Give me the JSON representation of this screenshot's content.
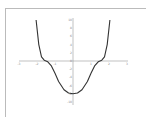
{
  "chart_data": {
    "type": "line",
    "title": "",
    "xlabel": "",
    "ylabel": "",
    "xlim": [
      -3,
      3
    ],
    "ylim": [
      -10,
      10
    ],
    "x_ticks": [
      "-3",
      "-2",
      "-1",
      "0",
      "1",
      "2",
      "3"
    ],
    "y_ticks": [
      "10",
      "8",
      "6",
      "4",
      "2",
      "0",
      "-2",
      "-4",
      "-6",
      "-8",
      "-10"
    ],
    "grid": false,
    "legend": null,
    "series": [
      {
        "name": "f(x)",
        "color": "#333333",
        "x": [
          -2.05,
          -1.9,
          -1.75,
          -1.6,
          -1.5,
          -1.4,
          -1.2,
          -1.0,
          -0.8,
          -0.5,
          -0.25,
          0,
          0.25,
          0.5,
          0.8,
          1.0,
          1.2,
          1.4,
          1.5,
          1.6,
          1.75,
          1.9,
          2.05
        ],
        "y": [
          10,
          4,
          1,
          0.2,
          0,
          -0.2,
          -1.2,
          -3.0,
          -5.0,
          -7.0,
          -7.8,
          -8,
          -7.8,
          -7.0,
          -5.0,
          -3.0,
          -1.2,
          -0.2,
          0,
          0.2,
          1,
          4,
          10
        ]
      }
    ]
  }
}
